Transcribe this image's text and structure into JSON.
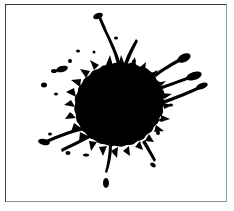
{
  "figure": {
    "background_color": "#ffffff",
    "ink_color": "#000000",
    "border": {
      "top_color": "#39393b",
      "left_color": "#3d3d3f",
      "right_color": "#9a9a9c",
      "bottom_color": "#8d8d8f",
      "width_px": 1,
      "inset_left_px": 5,
      "inset_top_px": 4,
      "frame_width_px": 222,
      "frame_height_px": 198
    },
    "canvas": {
      "width_px": 220,
      "height_px": 196
    }
  },
  "splatter": {
    "center_x": 108,
    "center_y": 100,
    "core_radius_x": 40,
    "core_radius_y": 38,
    "streak_count": 9,
    "droplet_count": 18,
    "core_label": "ink-core",
    "streaks_label": "ink-streaks",
    "droplets_label": "ink-droplets"
  }
}
